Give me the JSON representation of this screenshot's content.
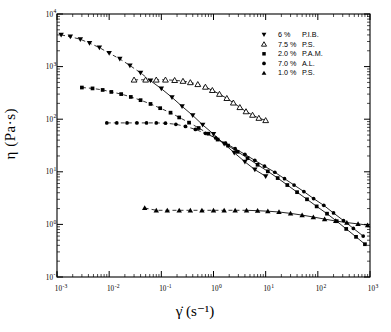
{
  "chart_data": {
    "type": "line",
    "title": "",
    "xlabel": "γ̇ (s⁻¹)",
    "ylabel": "η (Pa·s)",
    "xscale": "log",
    "yscale": "log",
    "xlim": [
      0.001,
      1000
    ],
    "ylim": [
      0.1,
      10000
    ],
    "grid": false,
    "legend_position": "top-right",
    "xticks": [
      "10⁻³",
      "10⁻²",
      "10⁻¹",
      "10⁰",
      "10¹",
      "10²",
      "10³"
    ],
    "xtick_values": [
      0.001,
      0.01,
      0.1,
      1,
      10,
      100,
      1000
    ],
    "yticks": [
      "10⁴",
      "10³",
      "10²",
      "10¹",
      "10⁰",
      "10⁻¹"
    ],
    "ytick_values": [
      10000,
      1000,
      100,
      10,
      1,
      0.1
    ],
    "series": [
      {
        "name": "6 %  P.I.B.",
        "marker": "triangle-down-filled",
        "linestyle": "dashed-to-solid",
        "x": [
          0.0012,
          0.0018,
          0.0028,
          0.0042,
          0.0065,
          0.01,
          0.016,
          0.025,
          0.04,
          0.062,
          0.1,
          0.16,
          0.25,
          0.4,
          0.62,
          1.0,
          1.6,
          2.5,
          4.0,
          6.2,
          10.0
        ],
        "y": [
          4000,
          3700,
          3300,
          2800,
          2300,
          1800,
          1400,
          1050,
          760,
          540,
          380,
          260,
          175,
          118,
          78,
          52,
          34,
          23,
          15.5,
          11.0,
          8.2
        ]
      },
      {
        "name": "7.5 %  P.S.",
        "marker": "triangle-up-open",
        "linestyle": "dashed-to-solid",
        "x": [
          0.03,
          0.05,
          0.08,
          0.12,
          0.18,
          0.26,
          0.36,
          0.5,
          0.7,
          0.95,
          1.3,
          1.8,
          2.4,
          3.2,
          4.2,
          5.6,
          7.4,
          10.0
        ],
        "y": [
          560,
          560,
          560,
          560,
          550,
          530,
          500,
          460,
          410,
          355,
          300,
          250,
          205,
          168,
          140,
          120,
          105,
          95
        ]
      },
      {
        "name": "2.0 %  P.A.M.",
        "marker": "square-filled",
        "linestyle": "dashed-to-solid",
        "x": [
          0.003,
          0.0048,
          0.0075,
          0.011,
          0.017,
          0.026,
          0.04,
          0.062,
          0.095,
          0.15,
          0.22,
          0.34,
          0.52,
          0.8,
          1.2,
          1.9,
          2.9,
          4.5,
          7.0,
          11.0,
          17.0,
          26.0,
          40.0,
          62.0,
          95.0,
          150.0,
          230.0,
          350.0,
          540.0,
          800.0
        ],
        "y": [
          400,
          385,
          360,
          330,
          300,
          265,
          230,
          195,
          162,
          133,
          108,
          86,
          68,
          53,
          41,
          31.5,
          24.0,
          18.2,
          13.6,
          10.2,
          7.6,
          5.6,
          4.1,
          3.0,
          2.2,
          1.6,
          1.15,
          0.82,
          0.58,
          0.42
        ]
      },
      {
        "name": "7.0 %  A.L.",
        "marker": "circle-filled",
        "linestyle": "dashed-to-solid",
        "x": [
          0.009,
          0.014,
          0.022,
          0.034,
          0.052,
          0.08,
          0.12,
          0.19,
          0.29,
          0.45,
          0.7,
          1.1,
          1.7,
          2.6,
          4.0,
          6.2,
          9.5,
          15.0,
          23.0,
          35.0,
          54.0,
          83.0,
          130.0,
          200.0,
          310.0,
          480.0,
          740.0
        ],
        "y": [
          85,
          85,
          85,
          85,
          85,
          85,
          84,
          80,
          73,
          64,
          54,
          44,
          35,
          27.5,
          21.5,
          16.5,
          12.8,
          9.8,
          7.4,
          5.6,
          4.2,
          3.1,
          2.3,
          1.65,
          1.18,
          0.84,
          0.6
        ]
      },
      {
        "name": "1.0 %  P.S.",
        "marker": "triangle-up-filled",
        "linestyle": "dashed-to-solid",
        "x": [
          0.048,
          0.08,
          0.13,
          0.22,
          0.36,
          0.6,
          1.0,
          1.6,
          2.6,
          4.3,
          7.0,
          11.0,
          18.0,
          30.0,
          50.0,
          82.0,
          135.0,
          220.0,
          360.0,
          590.0,
          900.0
        ],
        "y": [
          2.05,
          1.85,
          1.85,
          1.85,
          1.85,
          1.85,
          1.85,
          1.85,
          1.85,
          1.85,
          1.82,
          1.78,
          1.72,
          1.62,
          1.5,
          1.38,
          1.26,
          1.16,
          1.08,
          1.02,
          0.97
        ]
      }
    ]
  },
  "legend": {
    "entries": [
      {
        "marker": "triangle-down-filled",
        "pct": "6 %",
        "sample": "P.I.B."
      },
      {
        "marker": "triangle-up-open",
        "pct": "7.5 %",
        "sample": "P.S."
      },
      {
        "marker": "square-filled",
        "pct": "2.0 %",
        "sample": "P.A.M."
      },
      {
        "marker": "circle-filled",
        "pct": "7.0 %",
        "sample": "A.L."
      },
      {
        "marker": "triangle-up-filled",
        "pct": "1.0 %",
        "sample": "P.S."
      }
    ]
  },
  "colors": {
    "ink": "#000000",
    "background": "#ffffff"
  }
}
